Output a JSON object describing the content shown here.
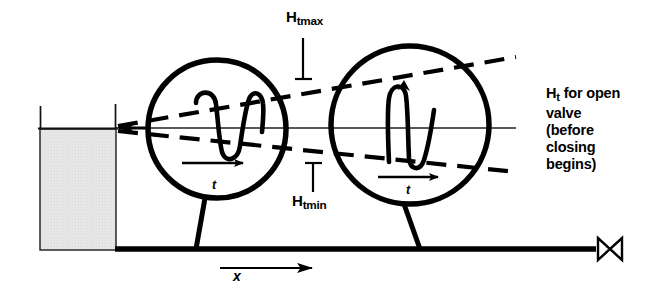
{
  "figure": {
    "background_color": "#ffffff",
    "line_color": "#000000",
    "reservoir_fill_color": "#e3e3e3"
  },
  "labels": {
    "h_t_max": {
      "base": "H",
      "subscript": "tmax",
      "text": "Htmax"
    },
    "h_t_min": {
      "base": "H",
      "subscript": "tmin",
      "text": "Htmin"
    },
    "h_t_open_valve": {
      "base": "H",
      "subscript": "t",
      "line1_rest": " for open",
      "line2": "valve",
      "line3": "(before",
      "line4": "closing",
      "line5": "begins)",
      "text": "Ht for open valve (before closing begins)"
    },
    "axis_x": "x",
    "time_left_tank": "t",
    "time_right_tank": "t"
  },
  "components": {
    "reservoir": {
      "name": "reservoir",
      "x": 40,
      "y": 128,
      "width": 76,
      "height": 122
    },
    "pipeline": {
      "name": "pipeline",
      "x1": 116,
      "y1": 249,
      "x2": 600,
      "y2": 249
    },
    "surge_tank_left": {
      "name": "surge-tank-upstream",
      "cx": 217,
      "cy": 129,
      "r": 70
    },
    "surge_tank_right": {
      "name": "surge-tank-downstream",
      "cx": 410,
      "cy": 125,
      "r": 80
    },
    "valve": {
      "name": "valve",
      "cx": 610,
      "cy": 249,
      "type": "gate-valve-bowtie"
    },
    "steady_hgl": {
      "name": "steady-hydraulic-grade-line",
      "x1": 113,
      "y1": 128,
      "x2": 516,
      "y2": 128
    },
    "envelope_upper": {
      "name": "hgl-envelope-max",
      "style": "dashed"
    },
    "envelope_lower": {
      "name": "hgl-envelope-min",
      "style": "dashed"
    }
  }
}
